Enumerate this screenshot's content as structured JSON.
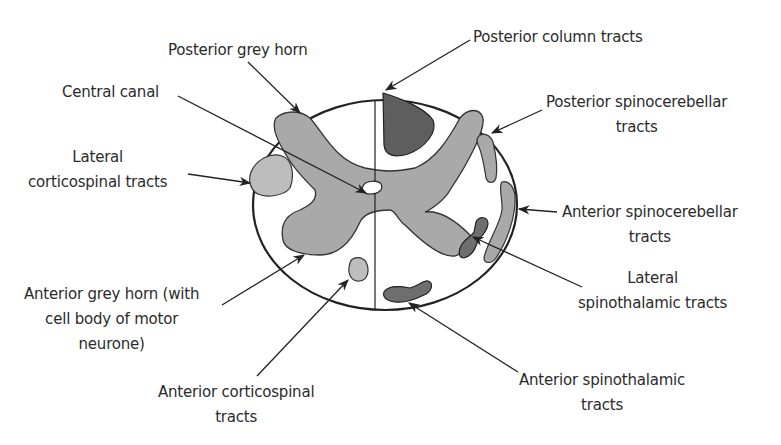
{
  "diagram": {
    "colors": {
      "background": "#ffffff",
      "outline": "#222222",
      "grey_matter": "#a9a9a9",
      "light_tract": "#bdbdbd",
      "dark_tract": "#6e6e6e",
      "posterior_column": "#5e5e5e",
      "label_text": "#2b2b2b"
    },
    "labels": {
      "posterior_grey_horn": {
        "lines": [
          "Posterior grey horn"
        ]
      },
      "central_canal": {
        "lines": [
          "Central canal"
        ]
      },
      "lateral_corticospinal": {
        "lines": [
          "Lateral",
          "corticospinal tracts"
        ]
      },
      "anterior_grey_horn": {
        "lines": [
          "Anterior grey horn (with",
          "cell body of motor",
          "neurone)"
        ]
      },
      "anterior_corticospinal": {
        "lines": [
          "Anterior corticospinal",
          "tracts"
        ]
      },
      "posterior_column": {
        "lines": [
          "Posterior column tracts"
        ]
      },
      "posterior_spinocerebellar": {
        "lines": [
          "Posterior spinocerebellar",
          "tracts"
        ]
      },
      "anterior_spinocerebellar": {
        "lines": [
          "Anterior spinocerebellar",
          "tracts"
        ]
      },
      "lateral_spinothalamic": {
        "lines": [
          "Lateral",
          "spinothalamic tracts"
        ]
      },
      "anterior_spinothalamic": {
        "lines": [
          "Anterior spinothalamic",
          "tracts"
        ]
      }
    }
  }
}
